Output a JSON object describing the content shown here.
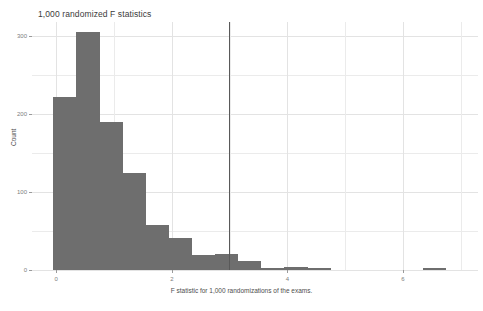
{
  "chart_data": {
    "type": "bar",
    "title": "1,000 randomized F statistics",
    "subtitle": "",
    "xlabel": "F statistic for 1,000 randomizations of the exams.",
    "ylabel": "Count",
    "xlim": [
      -0.42,
      7.3
    ],
    "ylim": [
      0,
      318
    ],
    "grid": true,
    "legend": "none",
    "bar_color": "#6e6e6e",
    "background_color": "#ffffff",
    "gridline_color": "#ebebeb",
    "bin_width": 0.4,
    "y_ticks": [
      0,
      100,
      200,
      300
    ],
    "y_tick_labels": [
      "0",
      "100",
      "200",
      "300"
    ],
    "y_minor_ticks": [
      50,
      150,
      250
    ],
    "x_ticks": [
      0,
      2,
      4,
      6
    ],
    "x_tick_labels": [
      "0",
      "2",
      "4",
      "6"
    ],
    "bins": [
      {
        "x_start": -0.05,
        "x_end": 0.35,
        "count": 222
      },
      {
        "x_start": 0.35,
        "x_end": 0.75,
        "count": 305
      },
      {
        "x_start": 0.75,
        "x_end": 1.15,
        "count": 190
      },
      {
        "x_start": 1.15,
        "x_end": 1.55,
        "count": 124
      },
      {
        "x_start": 1.55,
        "x_end": 1.95,
        "count": 58
      },
      {
        "x_start": 1.95,
        "x_end": 2.35,
        "count": 41
      },
      {
        "x_start": 2.35,
        "x_end": 2.75,
        "count": 19
      },
      {
        "x_start": 2.75,
        "x_end": 3.15,
        "count": 20
      },
      {
        "x_start": 3.15,
        "x_end": 3.55,
        "count": 12
      },
      {
        "x_start": 3.55,
        "x_end": 3.95,
        "count": 3
      },
      {
        "x_start": 3.95,
        "x_end": 4.35,
        "count": 4
      },
      {
        "x_start": 4.35,
        "x_end": 4.75,
        "count": 2
      },
      {
        "x_start": 6.35,
        "x_end": 6.75,
        "count": 2
      }
    ],
    "annotations": [
      {
        "name": "observed-f-statistic-line",
        "type": "vline",
        "x": 3.0,
        "y_top": 318,
        "color": "#595959",
        "label": ""
      }
    ]
  }
}
